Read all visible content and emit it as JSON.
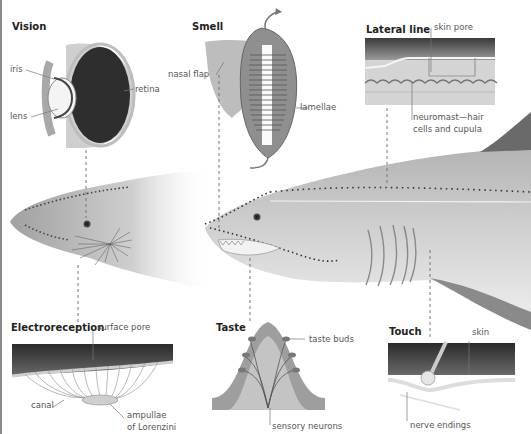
{
  "figure": {
    "panels": [
      {
        "id": "vision",
        "title": "Vision",
        "labels": [
          "iris",
          "lens",
          "retina"
        ]
      },
      {
        "id": "smell",
        "title": "Smell",
        "labels": [
          "nasal flap",
          "lamellae"
        ]
      },
      {
        "id": "lateral_line",
        "title": "Lateral line",
        "labels": [
          "skin pore",
          "neuromast—hair",
          "cells and cupula"
        ]
      },
      {
        "id": "electroreception",
        "title": "Electroreception",
        "labels": [
          "surface pore",
          "canal",
          "ampullae",
          "of Lorenzini"
        ]
      },
      {
        "id": "taste",
        "title": "Taste",
        "labels": [
          "taste buds",
          "sensory neurons"
        ]
      },
      {
        "id": "touch",
        "title": "Touch",
        "labels": [
          "skin",
          "nerve endings"
        ]
      }
    ]
  },
  "colors": {
    "shark_light": "#e6e6e6",
    "shark_dark": "#9a9a9a",
    "skin_dark": "#3a3a3a",
    "leader_line": "#777777"
  }
}
